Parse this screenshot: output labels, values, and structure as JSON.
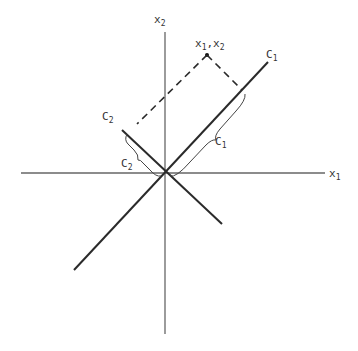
{
  "diagram": {
    "type": "coordinate-rotation",
    "colors": {
      "axis": "#666666",
      "rotated_axis": "#2a2a2a",
      "dashed": "#2a2a2a",
      "label": "#333333"
    },
    "axes": {
      "x1": {
        "label": "x",
        "sub": "1"
      },
      "x2": {
        "label": "x",
        "sub": "2"
      }
    },
    "rotated_axes": {
      "c1": {
        "label": "C",
        "sub": "1"
      },
      "c2": {
        "label": "C",
        "sub": "2"
      }
    },
    "point": {
      "label_a": "x",
      "sub_a": "1",
      "sep": ",",
      "label_b": "x",
      "sub_b": "2"
    },
    "projections": {
      "c1": {
        "label": "C",
        "sub": "1"
      },
      "c2": {
        "label": "C",
        "sub": "2"
      }
    }
  }
}
